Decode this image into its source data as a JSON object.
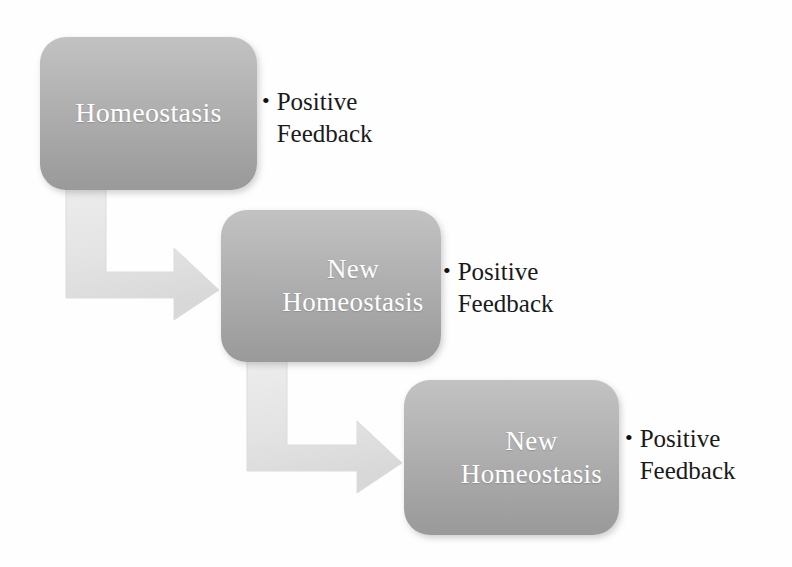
{
  "diagram": {
    "background_color": "#fefefe",
    "box_fill_top": "#c2c2c2",
    "box_fill_bottom": "#9a9a9a",
    "box_text_color": "#ffffff",
    "arrow_color": "#e4e4e4",
    "label_text_color": "#1a1a1a"
  },
  "nodes": [
    {
      "id": "node-1",
      "label": "Homeostasis",
      "feedback": {
        "bullet": "•",
        "text": "Positive\nFeedback"
      }
    },
    {
      "id": "node-2",
      "label": "New\nHomeostasis",
      "feedback": {
        "bullet": "•",
        "text": "Positive\nFeedback"
      }
    },
    {
      "id": "node-3",
      "label": "New\nHomeostasis",
      "feedback": {
        "bullet": "•",
        "text": "Positive\nFeedback"
      }
    }
  ],
  "connectors": [
    {
      "id": "arrow-1",
      "from": "node-1",
      "to": "node-2",
      "shape": "elbow-down-right"
    },
    {
      "id": "arrow-2",
      "from": "node-2",
      "to": "node-3",
      "shape": "elbow-down-right"
    }
  ]
}
